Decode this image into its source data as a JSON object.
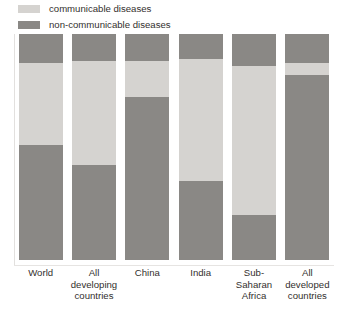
{
  "legend": {
    "items": [
      {
        "label": "communicable diseases",
        "color": "#d5d3d0",
        "icon": "legend-swatch"
      },
      {
        "label": "non-communicable diseases",
        "color": "#8a8885",
        "icon": "legend-swatch"
      }
    ]
  },
  "colors": {
    "communicable": "#d5d3d0",
    "non_communicable": "#8a8885",
    "background": "#ffffff",
    "text": "#332f2e",
    "axis": "#e2e0de"
  },
  "chart_data": {
    "type": "bar",
    "title": "",
    "subtitle": "",
    "xlabel": "",
    "ylabel": "",
    "ylim": [
      0,
      100
    ],
    "grid": false,
    "stacked": true,
    "legend_position": "top-left",
    "categories": [
      "World",
      "All developing countries",
      "China",
      "India",
      "Sub-Saharan Africa",
      "All developed countries"
    ],
    "category_lines": [
      [
        "World"
      ],
      [
        "All",
        "developing",
        "countries"
      ],
      [
        "China"
      ],
      [
        "India"
      ],
      [
        "Sub-",
        "Saharan",
        "Africa"
      ],
      [
        "All",
        "developed",
        "countries"
      ]
    ],
    "series": [
      {
        "name": "non-communicable diseases (top)",
        "key": "injuries_top_dark",
        "color": "#8a8885",
        "values": [
          13,
          12,
          12,
          11,
          14,
          13
        ]
      },
      {
        "name": "communicable diseases",
        "key": "communicable",
        "color": "#d5d3d0",
        "values": [
          36,
          46,
          16,
          54,
          66,
          5
        ]
      },
      {
        "name": "non-communicable diseases",
        "key": "non_communicable",
        "color": "#8a8885",
        "values": [
          51,
          42,
          72,
          35,
          20,
          82
        ]
      }
    ]
  }
}
